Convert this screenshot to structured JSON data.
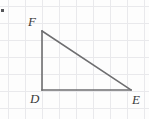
{
  "figure": {
    "name": "right-triangle-def",
    "width": 149,
    "height": 119,
    "background_color": "#fdfdfd",
    "grid": {
      "visible": true,
      "color": "#e9e9ec",
      "spacing_px": 17,
      "origin_x": 8,
      "origin_y": 6,
      "x_lines": [
        8,
        25,
        42,
        59,
        76,
        93,
        110,
        127,
        144
      ],
      "y_lines": [
        6,
        23,
        40,
        57,
        74,
        91,
        108
      ]
    },
    "stroke_color": "#6e6e70",
    "stroke_width": 1.6,
    "vertices": [
      {
        "id": "F",
        "label": "F",
        "x": 42,
        "y": 31,
        "label_x": 28,
        "label_y": 15
      },
      {
        "id": "D",
        "label": "D",
        "x": 42,
        "y": 90,
        "label_x": 30,
        "label_y": 92
      },
      {
        "id": "E",
        "label": "E",
        "x": 131,
        "y": 90,
        "label_x": 132,
        "label_y": 93
      }
    ],
    "edges": [
      {
        "id": "DF",
        "from": "D",
        "to": "F",
        "role": "vertical-leg"
      },
      {
        "id": "DE",
        "from": "D",
        "to": "E",
        "role": "horizontal-leg"
      },
      {
        "id": "FE",
        "from": "F",
        "to": "E",
        "role": "hypotenuse"
      }
    ],
    "right_angle_at": "D",
    "edge_mark": {
      "name": "left-edge-mark",
      "color": "#55565a",
      "x": 1,
      "y": 9,
      "width": 3,
      "height": 3
    }
  }
}
